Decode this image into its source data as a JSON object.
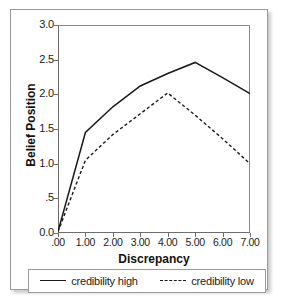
{
  "chart_data": {
    "type": "line",
    "title": "",
    "xlabel": "Discrepancy",
    "ylabel": "Belief Position",
    "xlim": [
      0,
      7
    ],
    "ylim": [
      0,
      3.0
    ],
    "grid": false,
    "legend_position": "bottom",
    "xticks": [
      0,
      1,
      2,
      3,
      4,
      5,
      6,
      7
    ],
    "xticklabels": [
      ".00",
      "1.00",
      "2.00",
      "3.00",
      "4.00",
      "5.00",
      "6.00",
      "7.00"
    ],
    "yticks": [
      0.0,
      0.5,
      1.0,
      1.5,
      2.0,
      2.5,
      3.0
    ],
    "yticklabels": [
      "0.0",
      ".5",
      "1.0",
      "1.5",
      "2.0",
      "2.5",
      "3.0"
    ],
    "x": [
      0,
      1,
      2,
      3,
      4,
      5,
      6,
      7
    ],
    "series": [
      {
        "name": "credibility high",
        "style": "solid",
        "color": "#1a1a1a",
        "values": [
          0.02,
          1.45,
          1.82,
          2.12,
          2.3,
          2.46,
          2.24,
          2.01
        ]
      },
      {
        "name": "credibility low",
        "style": "dashed",
        "color": "#1a1a1a",
        "values": [
          0.02,
          1.05,
          1.42,
          1.72,
          2.02,
          1.7,
          1.36,
          1.0
        ]
      }
    ]
  },
  "legend": {
    "entries": [
      {
        "label": "credibility high",
        "style": "solid"
      },
      {
        "label": "credibility low",
        "style": "dashed"
      }
    ]
  },
  "axes": {
    "x_title": "Discrepancy",
    "y_title": "Belief Position"
  }
}
